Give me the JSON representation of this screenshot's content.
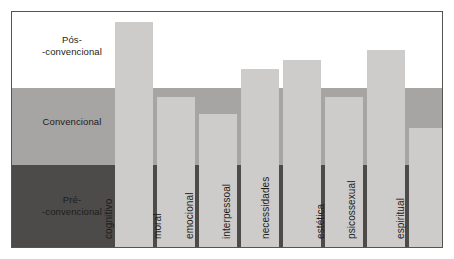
{
  "chart_data": {
    "type": "bar",
    "title": "",
    "subtitle": "",
    "xlabel": "",
    "ylabel": "",
    "grid": false,
    "legend": "none",
    "orientation": "vertical",
    "ylim": [
      0,
      100
    ],
    "categories": [
      "cognitivo",
      "moral",
      "emocional",
      "interpessoal",
      "necessidades",
      "estética",
      "psicossexual",
      "espiritual"
    ],
    "values": [
      96,
      63,
      56,
      76,
      80,
      63,
      85,
      50
    ],
    "value_unit": "nível de desenvolvimento (relativo)",
    "bands": [
      {
        "name": "Pós-convencional",
        "label": "Pós-\n-convencional",
        "range": [
          68,
          100
        ],
        "color": "#ffffff"
      },
      {
        "name": "Convencional",
        "label": "Convencional",
        "range": [
          35,
          68
        ],
        "color": "#a6a5a4"
      },
      {
        "name": "Pré-convencional",
        "label": "Pré-\n-convencional",
        "range": [
          0,
          35
        ],
        "color": "#4c4b4a"
      }
    ],
    "bar_color": "#cdcccb",
    "frame_color": "#555453"
  },
  "bars": [
    {
      "label": "cognitivo",
      "left": 103,
      "width": 38,
      "top": 10
    },
    {
      "label": "moral",
      "left": 145,
      "width": 38,
      "top": 85
    },
    {
      "label": "emocional",
      "left": 187,
      "width": 38,
      "top": 102
    },
    {
      "label": "interpessoal",
      "left": 229,
      "width": 38,
      "top": 57
    },
    {
      "label": "necessidades",
      "left": 271,
      "width": 38,
      "top": 48
    },
    {
      "label": "estética",
      "left": 313,
      "width": 38,
      "top": 85
    },
    {
      "label": "psicossexual",
      "left": 355,
      "width": 38,
      "top": 38
    },
    {
      "label": "espiritual",
      "left": 397,
      "width": 35,
      "top": 116
    }
  ],
  "bands": {
    "post": {
      "label": "Pós-\n-convencional"
    },
    "conventional": {
      "label": "Convencional"
    },
    "pre": {
      "label": "Pré-\n-convencional"
    }
  }
}
